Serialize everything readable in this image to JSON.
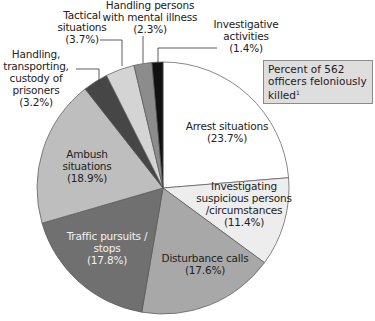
{
  "chart_data": {
    "type": "pie",
    "title": "Percent of 562 officers feloniously killed",
    "title_footnote": "1",
    "start_angle_deg": 0,
    "direction": "clockwise",
    "center": [
      163,
      188
    ],
    "radius": 126,
    "slices": [
      {
        "label": "Arrest situations",
        "value": 23.7,
        "display": "(23.7%)",
        "color": "#ffffff"
      },
      {
        "label": "Investigating suspicious persons /circumstances",
        "value": 11.4,
        "display": "(11.4%)",
        "color": "#ededed"
      },
      {
        "label": "Disturbance calls",
        "value": 17.6,
        "display": "(17.6%)",
        "color": "#a8a8a8"
      },
      {
        "label": "Traffic pursuits / stops",
        "value": 17.8,
        "display": "(17.8%)",
        "color": "#707070"
      },
      {
        "label": "Ambush situations",
        "value": 18.9,
        "display": "(18.9%)",
        "color": "#bebebe"
      },
      {
        "label": "Handling, transporting, custody of prisoners",
        "value": 3.2,
        "display": "(3.2%)",
        "color": "#464646"
      },
      {
        "label": "Tactical situations",
        "value": 3.7,
        "display": "(3.7%)",
        "color": "#d4d4d4"
      },
      {
        "label": "Handling persons with mental illness",
        "value": 2.3,
        "display": "(2.3%)",
        "color": "#8c8c8c"
      },
      {
        "label": "Investigative activities",
        "value": 1.4,
        "display": "(1.4%)",
        "color": "#111111"
      }
    ]
  },
  "labels": {
    "arrest": {
      "l1": "Arrest situations",
      "l2": "(23.7%)"
    },
    "suspicious": {
      "l1": "Investigating",
      "l2": "suspicious persons",
      "l3": "/circumstances",
      "l4": "(11.4%)"
    },
    "disturbance": {
      "l1": "Disturbance calls",
      "l2": "(17.6%)"
    },
    "traffic": {
      "l1": "Traffic pursuits /",
      "l2": "stops",
      "l3": "(17.8%)"
    },
    "ambush": {
      "l1": "Ambush",
      "l2": "situations",
      "l3": "(18.9%)"
    },
    "prisoners": {
      "l1": "Handling,",
      "l2": "transporting,",
      "l3": "custody of",
      "l4": "prisoners",
      "l5": "(3.2%)"
    },
    "tactical": {
      "l1": "Tactical",
      "l2": "situations",
      "l3": "(3.7%)"
    },
    "mental": {
      "l1": "Handling persons",
      "l2": "with mental illness",
      "l3": "(2.3%)"
    },
    "investigative": {
      "l1": "Investigative",
      "l2": "activities",
      "l3": "(1.4%)"
    }
  },
  "legend": {
    "l1": "Percent of 562",
    "l2": "officers feloniously",
    "l3": "killed",
    "footnote": "1"
  }
}
